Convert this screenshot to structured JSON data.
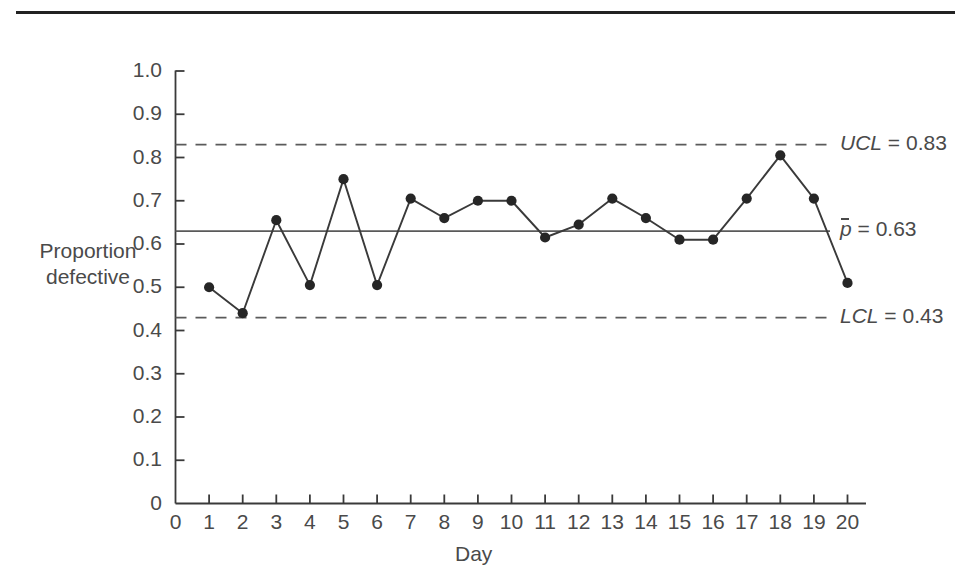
{
  "figure": {
    "name": "p-chart-proportion-defective",
    "top_rule": true
  },
  "axes": {
    "x_title": "Day",
    "y_title_line1": "Proportion",
    "y_title_line2": "defective",
    "y_ticks": [
      "1.0",
      "0.9",
      "0.8",
      "0.7",
      "0.6",
      "0.5",
      "0.4",
      "0.3",
      "0.2",
      "0.1",
      "0"
    ],
    "x_ticks": [
      "0",
      "1",
      "2",
      "3",
      "4",
      "5",
      "6",
      "7",
      "8",
      "9",
      "10",
      "11",
      "12",
      "13",
      "14",
      "15",
      "16",
      "17",
      "18",
      "19",
      "20"
    ]
  },
  "limits": {
    "ucl_label_prefix": "UCL",
    "ucl_label_eq": " = ",
    "ucl_value": "0.83",
    "center_label_prefix": "p",
    "center_label_eq": " = ",
    "center_value": "0.63",
    "lcl_label_prefix": "LCL",
    "lcl_label_eq": " = ",
    "lcl_value": "0.43"
  },
  "colors": {
    "line": "#3a3a3a",
    "marker": "#262626",
    "axis": "#3a3a3a",
    "limit": "#5a5a5a",
    "rule": "#222222"
  },
  "chart_data": {
    "type": "line",
    "title": "",
    "subtitle": "",
    "xlabel": "Day",
    "ylabel": "Proportion defective",
    "xlim": [
      0,
      20.6
    ],
    "ylim": [
      0,
      1.0
    ],
    "grid": false,
    "legend": false,
    "x": [
      1,
      2,
      3,
      4,
      5,
      6,
      7,
      8,
      9,
      10,
      11,
      12,
      13,
      14,
      15,
      16,
      17,
      18,
      19,
      20
    ],
    "series": [
      {
        "name": "Proportion defective",
        "values": [
          0.5,
          0.44,
          0.655,
          0.505,
          0.75,
          0.505,
          0.705,
          0.66,
          0.7,
          0.7,
          0.615,
          0.645,
          0.705,
          0.66,
          0.61,
          0.61,
          0.705,
          0.805,
          0.705,
          0.51
        ],
        "marker": "filled-circle",
        "line_style": "solid"
      }
    ],
    "annotations": [
      {
        "name": "ucl",
        "label": "UCL = 0.83",
        "value": 0.83,
        "style": "dashed",
        "orientation": "horizontal"
      },
      {
        "name": "center",
        "label": "p̄ = 0.63",
        "value": 0.63,
        "style": "solid",
        "orientation": "horizontal"
      },
      {
        "name": "lcl",
        "label": "LCL = 0.43",
        "value": 0.43,
        "style": "dashed",
        "orientation": "horizontal"
      }
    ]
  }
}
